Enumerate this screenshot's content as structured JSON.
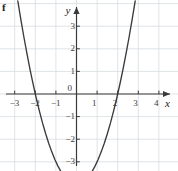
{
  "figure": {
    "label": "f"
  },
  "chart_data": {
    "type": "line",
    "title": "",
    "subtitle": "",
    "xlabel": "x",
    "ylabel": "y",
    "function": "y = x² − 4",
    "grid": true,
    "legend": "none",
    "xlim": [
      -3.5,
      4.5
    ],
    "ylim": [
      -4.4,
      3.8
    ],
    "xticks": [
      -3,
      -2,
      -1,
      1,
      2,
      3,
      4
    ],
    "yticks": [
      -4,
      -3,
      -2,
      -1,
      1,
      2,
      3
    ],
    "xtick_labels": [
      "−3",
      "−2",
      "−1",
      "1",
      "2",
      "3",
      "4"
    ],
    "ytick_labels": [
      "−4",
      "−3",
      "−2",
      "−1",
      "1",
      "2",
      "3"
    ],
    "origin_label": "0",
    "x_axis_arrow": true,
    "y_axis_arrow": true,
    "vertex": [
      0,
      -4
    ],
    "x_intercepts": [
      -2,
      2
    ],
    "y_intercept": -4,
    "series": [
      {
        "name": "y = x² − 4",
        "color": "#3a3a3a",
        "x": [
          -2.85,
          -2.7,
          -2.55,
          -2.4,
          -2.25,
          -2.1,
          -1.95,
          -1.8,
          -1.65,
          -1.5,
          -1.35,
          -1.2,
          -1.05,
          -0.9,
          -0.75,
          -0.6,
          -0.45,
          -0.3,
          -0.15,
          0,
          0.15,
          0.3,
          0.45,
          0.6,
          0.75,
          0.9,
          1.05,
          1.2,
          1.35,
          1.5,
          1.65,
          1.8,
          1.95,
          2.1,
          2.25,
          2.4,
          2.55,
          2.7,
          2.85
        ],
        "y": [
          4.12,
          3.29,
          2.5,
          1.76,
          1.06,
          0.41,
          -0.2,
          -0.76,
          -1.28,
          -1.75,
          -2.18,
          -2.56,
          -2.9,
          -3.19,
          -3.44,
          -3.64,
          -3.8,
          -3.91,
          -3.98,
          -4,
          -3.98,
          -3.91,
          -3.8,
          -3.64,
          -3.44,
          -3.19,
          -2.9,
          -2.56,
          -2.18,
          -1.75,
          -1.28,
          -0.76,
          -0.2,
          0.41,
          1.06,
          1.76,
          2.5,
          3.29,
          4.12
        ]
      }
    ],
    "colors": {
      "curve": "#3a3a3a",
      "axis": "#3a3a3a",
      "grid": "#d8dce0",
      "text": "#3a3a3a",
      "background": "#ffffff"
    }
  }
}
